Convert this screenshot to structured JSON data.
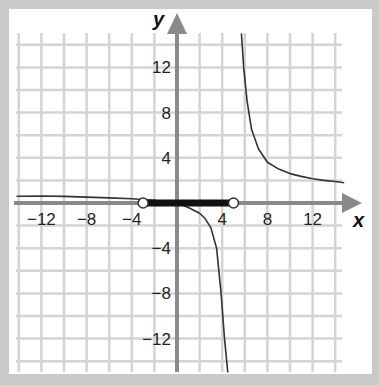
{
  "chart_data": {
    "type": "line",
    "title": "",
    "xlabel": "x",
    "ylabel": "y",
    "xlim": [
      -14,
      15
    ],
    "ylim": [
      -15,
      15
    ],
    "grid": true,
    "grid_step": 2,
    "x_ticks": [
      -12,
      -8,
      -4,
      4,
      8,
      12
    ],
    "y_ticks": [
      12,
      8,
      4,
      -4,
      -8,
      -12
    ],
    "x_tick_labels": [
      "−12",
      "−8",
      "−4",
      "4",
      "8",
      "12"
    ],
    "y_tick_labels": [
      "12",
      "8",
      "4",
      "−4",
      "−8",
      "−12"
    ],
    "vertical_asymptote_x": 4.6,
    "horizontal_asymptote_y": 0,
    "series": [
      {
        "name": "left branch",
        "x": [
          -14.2,
          -12,
          -10,
          -8,
          -6,
          -4,
          -2,
          0,
          1,
          2,
          2.5,
          3,
          3.5,
          3.9,
          4.2,
          4.4,
          4.5
        ],
        "y": [
          0.6,
          0.62,
          0.58,
          0.52,
          0.45,
          0.38,
          0.25,
          0,
          -0.4,
          -0.9,
          -1.4,
          -2.2,
          -4,
          -8,
          -12,
          -14,
          -15
        ]
      },
      {
        "name": "right branch",
        "x": [
          5.7,
          5.9,
          6.2,
          6.6,
          7.2,
          8,
          9,
          10,
          11,
          12,
          13,
          14,
          14.8
        ],
        "y": [
          15,
          12,
          9,
          6.5,
          4.8,
          3.6,
          3.0,
          2.6,
          2.35,
          2.15,
          2.0,
          1.9,
          1.8
        ]
      }
    ],
    "highlighted_interval": {
      "from": -3,
      "to": 5,
      "open_left": true,
      "open_right": true
    }
  },
  "labels": {
    "x_axis": "x",
    "y_axis": "y"
  }
}
